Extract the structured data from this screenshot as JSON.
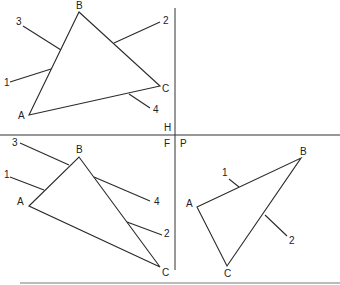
{
  "diagram": {
    "fold_labels": {
      "h": "H",
      "f": "F",
      "p": "P"
    },
    "views": [
      {
        "name": "top-view",
        "plane": "H",
        "triangle": {
          "A": {
            "x": 29,
            "y": 115,
            "label": "A"
          },
          "B": {
            "x": 79,
            "y": 12,
            "label": "B"
          },
          "C": {
            "x": 160,
            "y": 86,
            "label": "C"
          }
        },
        "lines": [
          {
            "label": "1",
            "from": [
              10,
              82
            ],
            "to": [
              51,
              69
            ],
            "label_pos": [
              4,
              86
            ]
          },
          {
            "label": "2",
            "from": [
              160,
              22
            ],
            "to": [
              114,
              43
            ],
            "label_pos": [
              163,
              24
            ]
          },
          {
            "label": "3",
            "from": [
              23,
              26
            ],
            "to": [
              61,
              50
            ],
            "label_pos": [
              16,
              25
            ]
          },
          {
            "label": "4",
            "from": [
              150,
              108
            ],
            "to": [
              129,
              94
            ],
            "label_pos": [
              153,
              113
            ]
          }
        ]
      },
      {
        "name": "front-view",
        "plane": "F",
        "triangle": {
          "A": {
            "x": 29,
            "y": 206,
            "label": "A"
          },
          "B": {
            "x": 79,
            "y": 157,
            "label": "B"
          },
          "C": {
            "x": 160,
            "y": 267,
            "label": "C"
          }
        },
        "lines": [
          {
            "label": "1",
            "from": [
              10,
              177
            ],
            "to": [
              44,
              190
            ],
            "label_pos": [
              4,
              178
            ]
          },
          {
            "label": "2",
            "from": [
              162,
              235
            ],
            "to": [
              127,
              222
            ],
            "label_pos": [
              164,
              237
            ]
          },
          {
            "label": "3",
            "from": [
              20,
              143
            ],
            "to": [
              69,
              165
            ],
            "label_pos": [
              12,
              146
            ]
          },
          {
            "label": "4",
            "from": [
              150,
              201
            ],
            "to": [
              94,
              177
            ],
            "label_pos": [
              154,
              205
            ]
          }
        ]
      },
      {
        "name": "auxiliary-view",
        "plane": "P",
        "triangle": {
          "A": {
            "x": 197,
            "y": 207,
            "label": "A"
          },
          "B": {
            "x": 301,
            "y": 158,
            "label": "B"
          },
          "C": {
            "x": 227,
            "y": 266,
            "label": "C"
          }
        },
        "lines": [
          {
            "label": "1",
            "from": [
              229,
              179
            ],
            "to": [
              239,
              187
            ],
            "label_pos": [
              222,
              176
            ]
          },
          {
            "label": "2",
            "from": [
              287,
              236
            ],
            "to": [
              265,
              215
            ],
            "label_pos": [
              289,
              244
            ]
          }
        ]
      }
    ],
    "colors": {
      "ink": "#2a2a2a",
      "background": "#ffffff"
    }
  }
}
